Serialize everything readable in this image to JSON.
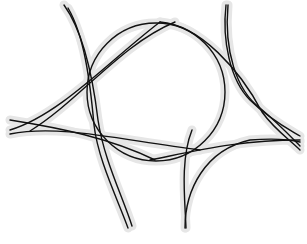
{
  "diagram": {
    "background_color": "#ffffff",
    "stroke_color": "#111111",
    "halo_color": "#e6e6e6",
    "central_circle": {
      "cx": 156,
      "cy": 92,
      "r": 69
    },
    "curves": [
      {
        "name": "top-left-arc-a",
        "d": "M 64 5 C 82 30, 92 70, 98 120 C 104 160, 122 195, 132 226"
      },
      {
        "name": "top-left-arc-b",
        "d": "M 68 8 C 84 35, 90 80, 94 125 C 98 160, 118 200, 128 228"
      },
      {
        "name": "upper-left-sweep-a",
        "d": "M 10 130 C 60 115, 110 60, 160 22"
      },
      {
        "name": "upper-left-sweep-b",
        "d": "M 30 131 C 80 100, 120 45, 175 22"
      },
      {
        "name": "lower-left-sweep-a",
        "d": "M 10 120 C 60 128, 110 138, 155 160"
      },
      {
        "name": "lower-left-sweep-b",
        "d": "M 10 134 C 60 124, 120 140, 200 150"
      },
      {
        "name": "top-right-arc-a",
        "d": "M 226 5 C 222 40, 230 80, 250 100 C 270 120, 290 130, 300 136"
      },
      {
        "name": "top-right-arc-b",
        "d": "M 228 5 C 224 50, 236 90, 260 108 C 280 125, 294 140, 300 146"
      },
      {
        "name": "upper-right-sweep",
        "d": "M 160 22 C 200 25, 240 70, 262 112 C 275 130, 290 140, 300 150"
      },
      {
        "name": "lower-right-sweep-a",
        "d": "M 150 160 C 200 150, 240 140, 300 140"
      },
      {
        "name": "lower-right-sweep-b",
        "d": "M 185 228 C 185 190, 205 150, 250 140 C 275 138, 292 140, 300 142"
      },
      {
        "name": "bottom-right-inner",
        "d": "M 192 130 C 180 160, 185 200, 186 228"
      }
    ]
  }
}
